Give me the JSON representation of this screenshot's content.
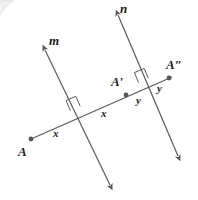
{
  "figure": {
    "background_color": "#ffffff",
    "stroke_color": "#555555",
    "label_color": "#1b1b1b",
    "point_color": "#555555"
  },
  "lines": {
    "m": {
      "name": "m",
      "label": "m",
      "label_pos": {
        "x": 49,
        "y": 34
      },
      "x1": 45,
      "y1": 50,
      "x2": 110,
      "y2": 185,
      "arrow_start": true,
      "arrow_end": true
    },
    "n": {
      "name": "n",
      "label": "n",
      "label_pos": {
        "x": 120,
        "y": 2
      },
      "x1": 118,
      "y1": 15,
      "x2": 178,
      "y2": 156,
      "arrow_start": true,
      "arrow_end": true
    },
    "transversal": {
      "name": "transversal",
      "label": "",
      "x1": 31,
      "y1": 139,
      "x2": 172,
      "y2": 77,
      "arrow_start": false,
      "arrow_end": false
    }
  },
  "points": [
    {
      "id": "A",
      "label": "A",
      "x": 31,
      "y": 139,
      "label_x": 18,
      "label_y": 145
    },
    {
      "id": "A-prime",
      "label": "A′",
      "x": 126,
      "y": 95,
      "label_x": 111,
      "label_y": 75
    },
    {
      "id": "A-double-prime",
      "label": "A″",
      "x": 169,
      "y": 78,
      "label_x": 166,
      "label_y": 58
    }
  ],
  "intersections": [
    {
      "id": "m-transversal",
      "x": 79,
      "y": 113,
      "right_angle": true
    },
    {
      "id": "n-transversal",
      "x": 147,
      "y": 85,
      "right_angle": true
    }
  ],
  "angle_labels": [
    {
      "id": "x-left",
      "text": "x",
      "x": 53,
      "y": 128
    },
    {
      "id": "x-right",
      "text": "x",
      "x": 101,
      "y": 108
    },
    {
      "id": "y-left",
      "text": "y",
      "x": 136,
      "y": 95
    },
    {
      "id": "y-right",
      "text": "y",
      "x": 157,
      "y": 83
    }
  ]
}
